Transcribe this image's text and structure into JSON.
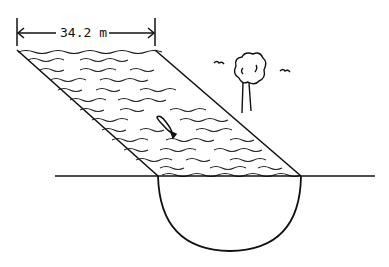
{
  "diagram": {
    "type": "illustration",
    "dimension": {
      "label": "34.2 m",
      "value": 34.2,
      "unit": "m",
      "describes": "width of river channel"
    },
    "elements": [
      {
        "name": "river-channel",
        "shape": "parallelogram",
        "fill": "wavy-lines"
      },
      {
        "name": "hemispherical-basin",
        "shape": "semicircle"
      },
      {
        "name": "ground-line",
        "shape": "line"
      },
      {
        "name": "tree",
        "shape": "sketch"
      },
      {
        "name": "birds",
        "count": 2
      },
      {
        "name": "fish",
        "count": 1
      }
    ],
    "colors": {
      "stroke": "#111111",
      "background": "#ffffff"
    }
  }
}
